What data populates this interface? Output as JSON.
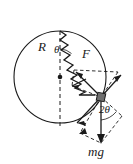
{
  "figure": {
    "kind": "free-body-diagram",
    "background_color": "#ffffff",
    "stroke_color": "#1a1a1a",
    "block_color": "#6e6e6e"
  },
  "labels": {
    "radius": "R",
    "theta": "θ",
    "spring_force": "F",
    "two_theta": "2θ",
    "weight": "mg"
  },
  "geometry": {
    "circle": {
      "cx": 60,
      "cy": 77,
      "r": 46
    },
    "center_dot": {
      "x": 60,
      "y": 77
    },
    "top_anchor": {
      "x": 60,
      "y": 31
    },
    "block": {
      "x": 101,
      "y": 97,
      "size": 7
    },
    "vertical_dashed": {
      "x": 60,
      "y1": 31,
      "y2": 126
    },
    "spring_turns": 9
  },
  "vectors": [
    {
      "name": "spring-force-F",
      "label": "F",
      "from": [
        101,
        97
      ],
      "to": [
        74,
        70
      ],
      "style": "solid"
    },
    {
      "name": "normal-component",
      "from": [
        101,
        97
      ],
      "to": [
        122,
        76
      ],
      "style": "solid"
    },
    {
      "name": "tangential-component",
      "from": [
        101,
        97
      ],
      "to": [
        77,
        124
      ],
      "style": "solid"
    },
    {
      "name": "weight-mg",
      "label": "mg",
      "from": [
        101,
        97
      ],
      "to": [
        101,
        143
      ],
      "style": "solid"
    },
    {
      "name": "mg-component-left",
      "from": [
        101,
        97
      ],
      "to": [
        80,
        133
      ],
      "style": "dashed"
    },
    {
      "name": "mg-component-right",
      "from": [
        101,
        97
      ],
      "to": [
        122,
        116
      ],
      "style": "dashed"
    }
  ],
  "construction_lines": [
    {
      "name": "upper-parallelogram",
      "style": "dashed"
    },
    {
      "name": "lower-parallelogram",
      "style": "dashed"
    },
    {
      "name": "angle-arc-theta",
      "style": "solid"
    },
    {
      "name": "angle-arc-2theta",
      "style": "solid"
    }
  ]
}
